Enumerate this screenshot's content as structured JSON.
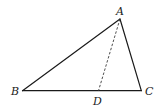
{
  "diagram": {
    "type": "geometry-triangle",
    "points": {
      "A": {
        "label": "A",
        "x": 120,
        "y": 19,
        "label_x": 116,
        "label_y": 15
      },
      "B": {
        "label": "B",
        "x": 22.5,
        "y": 90.7,
        "label_x": 12,
        "label_y": 95
      },
      "C": {
        "label": "C",
        "x": 141.3,
        "y": 90.7,
        "label_x": 145,
        "label_y": 95
      },
      "D": {
        "label": "D",
        "x": 98.5,
        "y": 90.7,
        "label_x": 93,
        "label_y": 105
      }
    },
    "segments": [
      {
        "from": "A",
        "to": "B",
        "style": "solid"
      },
      {
        "from": "A",
        "to": "C",
        "style": "solid"
      },
      {
        "from": "B",
        "to": "C",
        "style": "solid"
      },
      {
        "from": "A",
        "to": "D",
        "style": "dashed"
      }
    ],
    "colors": {
      "stroke": "#1a1a1a",
      "background": "#ffffff"
    }
  }
}
